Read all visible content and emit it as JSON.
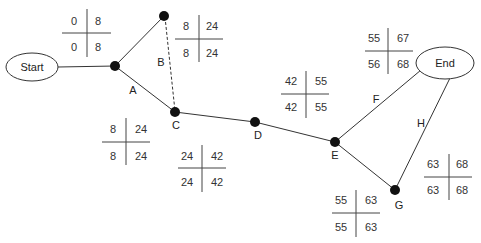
{
  "diagram": {
    "type": "activity-on-arrow network",
    "start_label": "Start",
    "end_label": "End",
    "activities": [
      {
        "id": "A",
        "from": "n1",
        "to": "nC",
        "style": "solid"
      },
      {
        "id": "B",
        "from": "nB",
        "to": "nC",
        "style": "dashed"
      },
      {
        "id": "C",
        "from": "nC",
        "to": "nD",
        "style": "solid"
      },
      {
        "id": "D",
        "from": "nD",
        "to": "nE",
        "style": "solid"
      },
      {
        "id": "E",
        "from": "nE",
        "to": "nG",
        "style": "solid"
      },
      {
        "id": "F",
        "from": "nE",
        "to": "end",
        "style": "solid"
      },
      {
        "id": "G",
        "from": "nG",
        "to": "end",
        "style": "solid"
      },
      {
        "id": "H",
        "from": "nG",
        "to": "end",
        "style": "solid"
      }
    ],
    "labels": {
      "A": "A",
      "B": "B",
      "C": "C",
      "D": "D",
      "E": "E",
      "F": "F",
      "G": "G",
      "H": "H"
    },
    "time_tables": [
      {
        "id": "t1",
        "tl": "0",
        "tr": "8",
        "bl": "0",
        "br": "8"
      },
      {
        "id": "t2",
        "tl": "8",
        "tr": "24",
        "bl": "8",
        "br": "24"
      },
      {
        "id": "t3",
        "tl": "8",
        "tr": "24",
        "bl": "8",
        "br": "24"
      },
      {
        "id": "t4",
        "tl": "24",
        "tr": "42",
        "bl": "24",
        "br": "42"
      },
      {
        "id": "t5",
        "tl": "42",
        "tr": "55",
        "bl": "42",
        "br": "55"
      },
      {
        "id": "t6",
        "tl": "55",
        "tr": "67",
        "bl": "56",
        "br": "68"
      },
      {
        "id": "t7",
        "tl": "63",
        "tr": "68",
        "bl": "63",
        "br": "68"
      },
      {
        "id": "t8",
        "tl": "55",
        "tr": "63",
        "bl": "55",
        "br": "63"
      }
    ],
    "colors": {
      "line": "#333333",
      "node": "#111111",
      "text": "#222222"
    }
  }
}
